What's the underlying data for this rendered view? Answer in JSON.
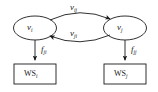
{
  "figure": {
    "type": "node-edge-diagram",
    "background_color": "#ffffff",
    "stroke_color": "#1a1a1a"
  },
  "nodes": [
    {
      "id": "vi",
      "shape": "ellipse",
      "label_base": "v",
      "label_sub": "i",
      "cx": 35,
      "cy": 28,
      "rx": 21,
      "ry": 12
    },
    {
      "id": "vj",
      "shape": "ellipse",
      "label_base": "v",
      "label_sub": "j",
      "cx": 125,
      "cy": 28,
      "rx": 21,
      "ry": 12
    }
  ],
  "boxes": [
    {
      "id": "wsi",
      "shape": "rectangle",
      "label_base": "WS",
      "label_sub": "i",
      "x": 14,
      "y": 64,
      "width": 42,
      "height": 20
    },
    {
      "id": "wsj",
      "shape": "rectangle",
      "label_base": "WS",
      "label_sub": "j",
      "x": 104,
      "y": 64,
      "width": 42,
      "height": 20
    }
  ],
  "edges": [
    {
      "id": "vij",
      "from": "vi",
      "to": "vj",
      "direction": "right",
      "curve": "arc-above",
      "label_base": "v",
      "label_sub": "ij"
    },
    {
      "id": "vji",
      "from": "vj",
      "to": "vi",
      "direction": "left",
      "curve": "arc-below",
      "label_base": "v",
      "label_sub": "ji"
    },
    {
      "id": "fji",
      "from": "vi",
      "to": "wsi",
      "direction": "down",
      "curve": "straight",
      "label_base": "f",
      "label_sub": "ji"
    },
    {
      "id": "fjj",
      "from": "vj",
      "to": "wsj",
      "direction": "down",
      "curve": "straight",
      "label_base": "f",
      "label_sub": "jj"
    }
  ]
}
